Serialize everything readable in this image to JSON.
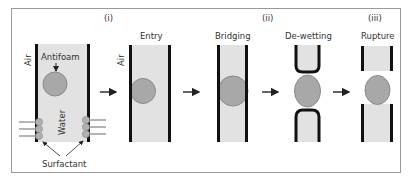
{
  "figure": {
    "stage_labels": {
      "i": "(i)",
      "ii": "(ii)",
      "iii": "(iii)"
    },
    "panels": [
      {
        "id": "initial",
        "title": "",
        "labels": {
          "air": "Air",
          "water": "Water",
          "antifoam": "Antifoam",
          "surfactant": "Surfactant"
        }
      },
      {
        "id": "entry",
        "title": "Entry",
        "labels": {
          "air": "Air"
        }
      },
      {
        "id": "bridging",
        "title": "Bridging"
      },
      {
        "id": "dewetting",
        "title": "De-wetting"
      },
      {
        "id": "rupture",
        "title": "Rupture"
      }
    ],
    "colors": {
      "frame": "#9a9a9a",
      "wall": "#111111",
      "film": "#e2e2e2",
      "droplet_fill": "#a8a8a8",
      "droplet_stroke": "#8a8a8a",
      "arrow": "#222222",
      "text": "#333333"
    }
  }
}
